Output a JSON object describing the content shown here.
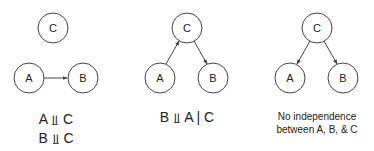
{
  "colors": {
    "stroke": "#444444",
    "text": "#222222",
    "background": "#ffffff"
  },
  "panels": [
    {
      "nodes": {
        "C": "C",
        "A": "A",
        "B": "B"
      },
      "edges": [
        {
          "from": "A",
          "to": "B"
        }
      ],
      "caption_lines": [
        "A ⫫ C",
        "B ⫫ C"
      ]
    },
    {
      "nodes": {
        "C": "C",
        "A": "A",
        "B": "B"
      },
      "edges": [
        {
          "from": "A",
          "to": "C"
        },
        {
          "from": "C",
          "to": "B"
        }
      ],
      "caption_lines": [
        "B ⫫ A | C"
      ]
    },
    {
      "nodes": {
        "C": "C",
        "A": "A",
        "B": "B"
      },
      "edges": [
        {
          "from": "C",
          "to": "A"
        },
        {
          "from": "C",
          "to": "B"
        }
      ],
      "caption_lines": [
        "No independence",
        "between A, B, & C"
      ]
    }
  ]
}
